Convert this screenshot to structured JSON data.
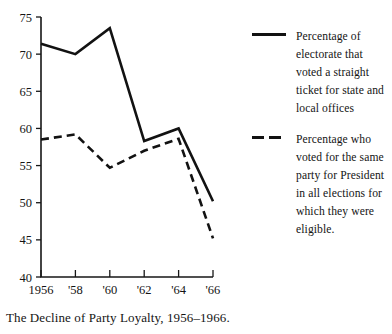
{
  "caption": "The Decline of Party Loyalty, 1956–1966.",
  "legend": {
    "entries": [
      {
        "style": "solid",
        "label": "Percentage of electorate that voted a straight ticket for state and local offices"
      },
      {
        "style": "dashed",
        "label": "Percentage who voted for the same party for President in all elections for which they were eligible."
      }
    ]
  },
  "chart_data": {
    "type": "line",
    "title": "The Decline of Party Loyalty, 1956–1966.",
    "xlabel": "",
    "ylabel": "",
    "x": [
      1956,
      1958,
      1960,
      1962,
      1964,
      1966
    ],
    "categories": [
      "1956",
      "'58",
      "'60",
      "'62",
      "'64",
      "'66"
    ],
    "xtick_labels": [
      "1956",
      "'58",
      "'60",
      "'62",
      "'64",
      "'66"
    ],
    "ytick_labels": [
      "75",
      "70",
      "65",
      "60",
      "55",
      "50",
      "45",
      "40"
    ],
    "yticks": [
      75,
      70,
      65,
      60,
      55,
      50,
      45,
      40
    ],
    "ylim": [
      40,
      75
    ],
    "xlim": [
      1956,
      1966
    ],
    "grid": false,
    "legend_position": "right",
    "series": [
      {
        "name": "Percentage of electorate that voted a straight ticket for state and local offices",
        "style": "solid",
        "values": [
          71.4,
          70.0,
          73.5,
          58.3,
          60.0,
          50.2
        ]
      },
      {
        "name": "Percentage who voted for the same party for President in all elections for which they were eligible.",
        "style": "dashed",
        "values": [
          58.5,
          59.2,
          54.7,
          57.0,
          58.6,
          45.2
        ]
      }
    ]
  },
  "colors": {
    "ink": "#121212",
    "background": "#ffffff"
  }
}
